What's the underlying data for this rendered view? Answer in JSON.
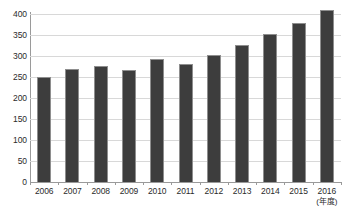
{
  "chart_data": {
    "type": "bar",
    "title": "",
    "subtitle": "",
    "xlabel": "(年度)",
    "ylabel": "",
    "categories": [
      "2006",
      "2007",
      "2008",
      "2009",
      "2010",
      "2011",
      "2012",
      "2013",
      "2014",
      "2015",
      "2016"
    ],
    "values": [
      250,
      268,
      277,
      266,
      292,
      280,
      303,
      327,
      353,
      378,
      409
    ],
    "series": [
      {
        "name": "",
        "values": [
          250,
          268,
          277,
          266,
          292,
          280,
          303,
          327,
          353,
          378,
          409
        ]
      }
    ],
    "ylim": [
      0,
      400
    ],
    "yticks": [
      0,
      50,
      100,
      150,
      200,
      250,
      300,
      350,
      400
    ],
    "ytick_labels": [
      "0",
      "50",
      "100",
      "150",
      "200",
      "250",
      "300",
      "350",
      "400"
    ],
    "xtick_labels": [
      "2006",
      "2007",
      "2008",
      "2009",
      "2010",
      "2011",
      "2012",
      "2013",
      "2014",
      "2015",
      "2016"
    ],
    "grid": true,
    "grid_axis": "y",
    "legend": false,
    "legend_position": "none",
    "annotations": [
      "(年度)"
    ],
    "colors": {
      "bar_fill": "#3d3d3d",
      "bar_edge": "#8e8e8e",
      "gridline": "#d8d8d8",
      "axis": "#9a9a9a",
      "text": "#2b2b2b",
      "background": "#ffffff"
    }
  }
}
